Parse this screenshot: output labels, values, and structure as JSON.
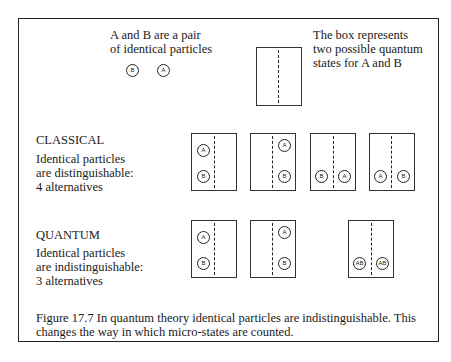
{
  "intro": {
    "particles_text_line1": "A and B are a pair",
    "particles_text_line2": "of identical particles",
    "sample_particles": [
      "B",
      "A"
    ],
    "box_text_line1": "The box represents",
    "box_text_line2": "two possible quantum",
    "box_text_line3": "states for A and B"
  },
  "classical": {
    "heading": "CLASSICAL",
    "line1": "Identical particles",
    "line2": "are distinguishable:",
    "line3": "4 alternatives",
    "alternatives": [
      {
        "left": [
          "A",
          "B"
        ],
        "right": []
      },
      {
        "left": [],
        "right": [
          "A",
          "B"
        ]
      },
      {
        "left": [
          "B"
        ],
        "right": [
          "A"
        ]
      },
      {
        "left": [
          "A"
        ],
        "right": [
          "B"
        ]
      }
    ]
  },
  "quantum": {
    "heading": "QUANTUM",
    "line1": "Identical particles",
    "line2": "are indistinguishable:",
    "line3": "3 alternatives",
    "alternatives": [
      {
        "left": [
          "A",
          "B"
        ],
        "right": []
      },
      {
        "left": [],
        "right": [
          "A",
          "B"
        ]
      },
      {
        "left": [
          "AB"
        ],
        "right": [
          "AB"
        ]
      }
    ]
  },
  "caption": "Figure 17.7 In quantum theory identical particles are indistinguishable. This changes the way in which micro-states are counted."
}
